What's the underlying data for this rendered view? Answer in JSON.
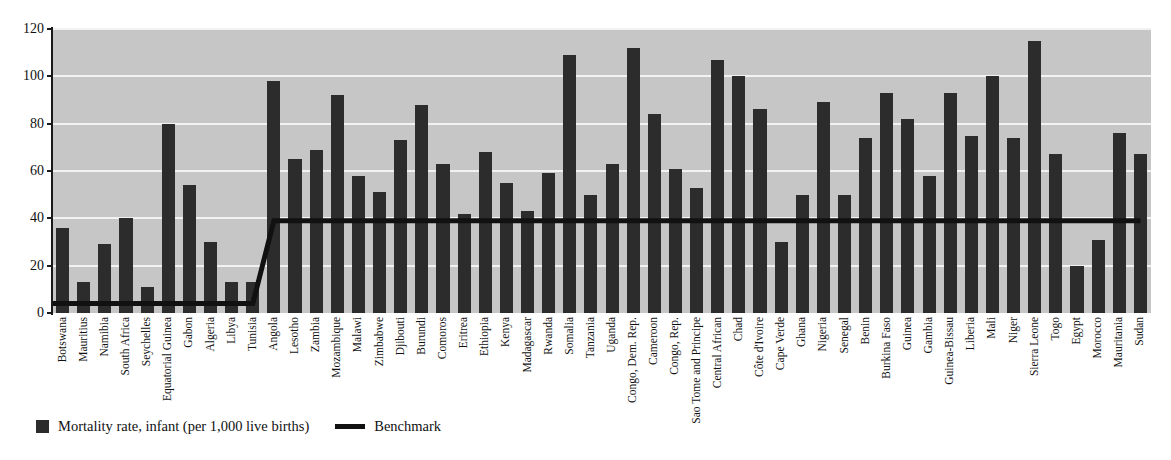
{
  "chart_data": {
    "type": "bar",
    "title": "",
    "subtitle": "",
    "xlabel": "",
    "ylabel": "",
    "ylim": [
      0,
      120
    ],
    "yticks": [
      0,
      20,
      40,
      60,
      80,
      100,
      120
    ],
    "grid": true,
    "legend_position": "bottom-left",
    "categories": [
      "Botswana",
      "Mauritius",
      "Namibia",
      "South Africa",
      "Seychelles",
      "Equatorial Guinea",
      "Gabon",
      "Algeria",
      "Libya",
      "Tunisia",
      "Angola",
      "Lesotho",
      "Zambia",
      "Mozambique",
      "Malawi",
      "Zimbabwe",
      "Djibouti",
      "Burundi",
      "Comoros",
      "Eritrea",
      "Ethiopia",
      "Kenya",
      "Madagascar",
      "Rwanda",
      "Somalia",
      "Tanzania",
      "Uganda",
      "Congo, Dem. Rep.",
      "Cameroon",
      "Congo, Rep.",
      "Sao Tome and Principe",
      "Central African",
      "Chad",
      "Côte d'Ivoire",
      "Cape Verde",
      "Ghana",
      "Nigeria",
      "Senegal",
      "Benin",
      "Burkina Faso",
      "Guinea",
      "Gambia",
      "Guinea-Bissau",
      "Liberia",
      "Mali",
      "Niger",
      "Sierra Leone",
      "Togo",
      "Egypt",
      "Morocco",
      "Mauritania",
      "Sudan"
    ],
    "series": [
      {
        "name": "Mortality rate, infant (per 1,000 live births)",
        "type": "bar",
        "color": "#2c2c2c",
        "values": [
          36,
          13,
          29,
          40,
          11,
          80,
          54,
          30,
          13,
          13,
          98,
          65,
          69,
          92,
          58,
          51,
          73,
          88,
          63,
          42,
          68,
          55,
          43,
          59,
          109,
          50,
          63,
          112,
          84,
          61,
          53,
          107,
          100,
          86,
          30,
          50,
          89,
          50,
          74,
          93,
          82,
          58,
          93,
          75,
          100,
          74,
          115,
          67,
          20,
          31,
          76,
          67
        ]
      },
      {
        "name": "Benchmark",
        "type": "line",
        "color": "#111111",
        "values": [
          4,
          4,
          4,
          4,
          4,
          4,
          4,
          4,
          4,
          4,
          39,
          39,
          39,
          39,
          39,
          39,
          39,
          39,
          39,
          39,
          39,
          39,
          39,
          39,
          39,
          39,
          39,
          39,
          39,
          39,
          39,
          39,
          39,
          39,
          39,
          39,
          39,
          39,
          39,
          39,
          39,
          39,
          39,
          39,
          39,
          39,
          39,
          39,
          39,
          39,
          39,
          39
        ]
      }
    ]
  },
  "legend": {
    "entries": [
      {
        "label": "Mortality rate, infant (per 1,000 live births)",
        "marker": "square-swatch-icon"
      },
      {
        "label": "Benchmark",
        "marker": "line-swatch-icon"
      }
    ]
  }
}
